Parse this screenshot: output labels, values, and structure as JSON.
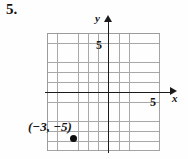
{
  "problem": {
    "number_label": "5."
  },
  "chart_data": {
    "type": "scatter",
    "title": "",
    "xlabel": "x",
    "ylabel": "y",
    "grid": true,
    "legend": false,
    "xlim": [
      -6,
      5
    ],
    "ylim": [
      -7,
      5
    ],
    "xticks_labeled": [
      5
    ],
    "yticks_labeled": [
      5
    ],
    "x_tick_label": "5",
    "y_tick_label": "5",
    "gridline_spacing": 1,
    "points": [
      {
        "x": -3,
        "y": -5,
        "label": "(−3, −5)",
        "marker": "filled-circle",
        "color": "#0d0d0d"
      }
    ],
    "axis_color": "#1b1b1b",
    "grid_color": "#9a9a9a",
    "background_color": "#fefefe"
  },
  "annotations": {
    "point_coordinate_label": "(−3, −5)"
  }
}
